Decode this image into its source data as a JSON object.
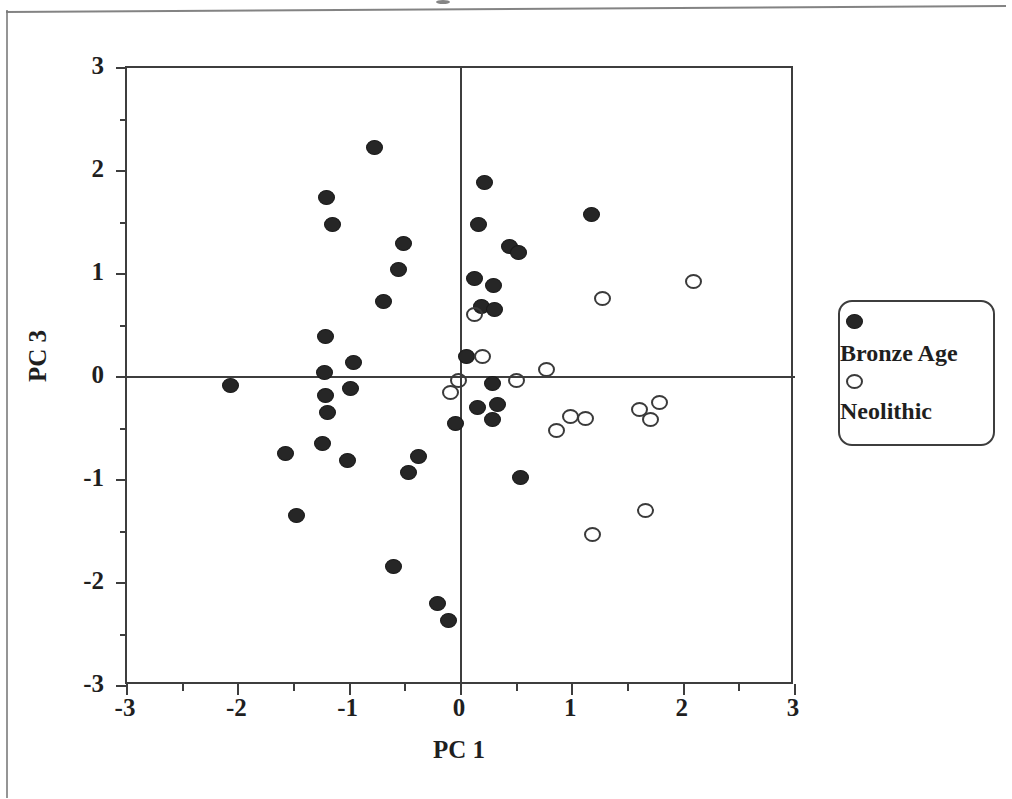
{
  "figure": {
    "x_axis": {
      "title": "PC 1",
      "min": -3,
      "max": 3,
      "major_ticks": [
        -3,
        -2,
        -1,
        0,
        1,
        2,
        3
      ],
      "minor_tick_step": 0.5,
      "tick_labels": [
        "-3",
        "-2",
        "-1",
        "0",
        "1",
        "2",
        "3"
      ]
    },
    "y_axis": {
      "title": "PC 3",
      "min": -3,
      "max": 3,
      "major_ticks": [
        -3,
        -2,
        -1,
        0,
        1,
        2,
        3
      ],
      "minor_tick_step": 0.5,
      "tick_labels": [
        "-3",
        "-2",
        "-1",
        "0",
        "1",
        "2",
        "3"
      ]
    },
    "legend": {
      "entries": [
        {
          "label": "Bronze Age",
          "marker": "filled-circle"
        },
        {
          "label": "Neolithic",
          "marker": "open-circle"
        }
      ]
    },
    "zero_lines": {
      "x": 0,
      "y": 0
    }
  },
  "chart_data": {
    "type": "scatter",
    "title": "",
    "xlabel": "PC 1",
    "ylabel": "PC 3",
    "xlim": [
      -3,
      3
    ],
    "ylim": [
      -3,
      3
    ],
    "grid": false,
    "legend_position": "right",
    "xticks": [
      -3,
      -2,
      -1,
      0,
      1,
      2,
      3
    ],
    "yticks": [
      -3,
      -2,
      -1,
      0,
      1,
      2,
      3
    ],
    "annotations": [
      "horizontal reference line at PC 3 = 0",
      "vertical reference line at PC 1 = 0"
    ],
    "series": [
      {
        "name": "Bronze Age",
        "marker": "filled-circle",
        "color": "#262626",
        "points": [
          [
            -0.78,
            2.23
          ],
          [
            -1.21,
            1.74
          ],
          [
            -1.15,
            1.48
          ],
          [
            0.21,
            1.89
          ],
          [
            0.16,
            1.48
          ],
          [
            1.17,
            1.58
          ],
          [
            -0.52,
            1.3
          ],
          [
            0.44,
            1.27
          ],
          [
            0.52,
            1.21
          ],
          [
            -0.56,
            1.04
          ],
          [
            0.12,
            0.96
          ],
          [
            0.29,
            0.89
          ],
          [
            -0.7,
            0.73
          ],
          [
            0.18,
            0.68
          ],
          [
            0.3,
            0.66
          ],
          [
            -1.22,
            0.39
          ],
          [
            -0.97,
            0.14
          ],
          [
            -1.23,
            0.04
          ],
          [
            0.05,
            0.2
          ],
          [
            -2.07,
            -0.08
          ],
          [
            -1.22,
            -0.18
          ],
          [
            -0.99,
            -0.11
          ],
          [
            0.28,
            -0.06
          ],
          [
            -1.2,
            -0.34
          ],
          [
            0.33,
            -0.27
          ],
          [
            0.15,
            -0.3
          ],
          [
            0.28,
            -0.41
          ],
          [
            -0.05,
            -0.45
          ],
          [
            -1.58,
            -0.74
          ],
          [
            -1.24,
            -0.65
          ],
          [
            -1.02,
            -0.81
          ],
          [
            -0.38,
            -0.77
          ],
          [
            -0.47,
            -0.93
          ],
          [
            0.53,
            -0.98
          ],
          [
            -1.48,
            -1.34
          ],
          [
            -0.61,
            -1.84
          ],
          [
            -0.21,
            -2.2
          ],
          [
            -0.11,
            -2.36
          ]
        ]
      },
      {
        "name": "Neolithic",
        "marker": "open-circle",
        "color": "#3a3a3a",
        "points": [
          [
            2.09,
            0.93
          ],
          [
            1.27,
            0.76
          ],
          [
            0.12,
            0.61
          ],
          [
            0.19,
            0.2
          ],
          [
            0.77,
            0.07
          ],
          [
            0.5,
            -0.03
          ],
          [
            -0.02,
            -0.03
          ],
          [
            -0.09,
            -0.15
          ],
          [
            1.78,
            -0.25
          ],
          [
            1.6,
            -0.32
          ],
          [
            0.98,
            -0.38
          ],
          [
            1.12,
            -0.4
          ],
          [
            1.7,
            -0.41
          ],
          [
            0.86,
            -0.52
          ],
          [
            1.66,
            -1.3
          ],
          [
            1.18,
            -1.53
          ]
        ]
      }
    ]
  }
}
